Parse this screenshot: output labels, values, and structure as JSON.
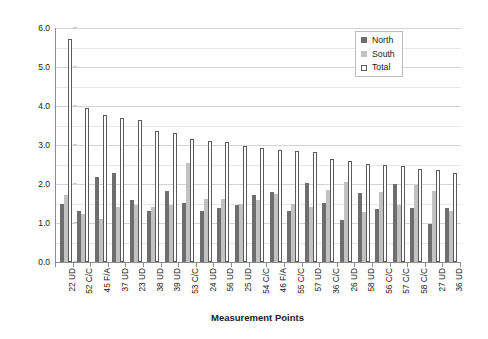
{
  "chart_data": {
    "type": "bar",
    "title": "",
    "xlabel": "Measurement Points",
    "ylabel": "Variation (6σ, mm)",
    "ylim": [
      0.0,
      6.0
    ],
    "ytick_labels": [
      "0.0",
      "1.0",
      "2.0",
      "3.0",
      "4.0",
      "5.0",
      "6.0"
    ],
    "ytick_values": [
      0.0,
      1.0,
      2.0,
      3.0,
      4.0,
      5.0,
      6.0
    ],
    "grid": "horizontal major and minor (0.5 step)",
    "legend_position": "top-right inside plot",
    "categories": [
      "22 UD",
      "52 C/C",
      "45 F/A",
      "37 UD",
      "23 UD",
      "38 UD",
      "39 UD",
      "53 C/C",
      "24 UD",
      "56 UD",
      "25 UD",
      "54 C/C",
      "46 F/A",
      "55 C/C",
      "57 UD",
      "36 C/C",
      "26 UD",
      "58 UD",
      "56 C/C",
      "57 C/C",
      "58 C/C",
      "27 UD",
      "36 UD"
    ],
    "series": [
      {
        "name": "North",
        "color": "#6e6e6e",
        "values": [
          1.48,
          1.3,
          2.17,
          2.28,
          1.58,
          1.32,
          1.82,
          1.52,
          1.32,
          1.38,
          1.45,
          1.72,
          1.8,
          1.32,
          2.02,
          1.52,
          1.08,
          1.78,
          1.35,
          2.0,
          1.38,
          0.98,
          1.38
        ]
      },
      {
        "name": "South",
        "color": "#c2c2c2",
        "values": [
          1.72,
          1.22,
          1.1,
          1.42,
          1.45,
          1.42,
          1.45,
          2.55,
          1.62,
          1.62,
          1.48,
          1.58,
          1.75,
          1.5,
          1.42,
          1.85,
          2.05,
          1.28,
          1.8,
          1.45,
          1.98,
          1.82,
          1.3
        ]
      },
      {
        "name": "Total",
        "color": "#ffffff",
        "values": [
          5.72,
          3.95,
          3.78,
          3.7,
          3.65,
          3.35,
          3.32,
          3.15,
          3.1,
          3.07,
          2.98,
          2.92,
          2.88,
          2.85,
          2.82,
          2.65,
          2.58,
          2.52,
          2.48,
          2.45,
          2.38,
          2.35,
          2.27
        ]
      }
    ]
  },
  "legend": {
    "items": [
      {
        "label": "North",
        "swatch": "north"
      },
      {
        "label": "South",
        "swatch": "south"
      },
      {
        "label": "Total",
        "swatch": "total"
      }
    ]
  }
}
